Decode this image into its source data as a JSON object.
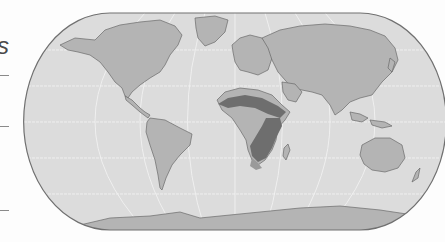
{
  "figure": {
    "type": "world map (Eckert-style pseudocylindrical projection)",
    "left_fragment_text": "s",
    "left_dash_positions_y": [
      75,
      126,
      210
    ],
    "colors": {
      "background": "#fdfdfd",
      "ocean": "#dcdcdc",
      "land": "#b4b4b4",
      "highlight_dark": "#6e6e6e",
      "highlight_mid": "#9a9a9a",
      "coast": "#6a6a6a",
      "graticule": "#f4f4f4",
      "border": "#707070"
    },
    "highlighted_region": "Sub-Saharan Africa band (Sahel) and southern/eastern Africa"
  }
}
